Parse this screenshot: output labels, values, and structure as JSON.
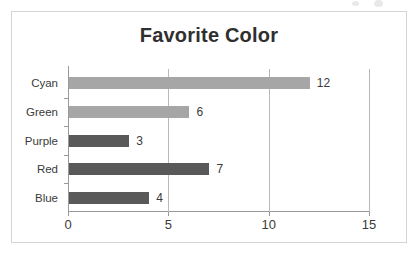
{
  "chart_data": {
    "type": "bar",
    "orientation": "horizontal",
    "title": "Favorite Color",
    "xlabel": "",
    "ylabel": "",
    "categories": [
      "Cyan",
      "Green",
      "Purple",
      "Red",
      "Blue"
    ],
    "values": [
      12,
      6,
      3,
      7,
      4
    ],
    "value_labels": [
      "12",
      "6",
      "3",
      "7",
      "4"
    ],
    "bar_colors": [
      "#a6a6a6",
      "#a6a6a6",
      "#595959",
      "#595959",
      "#595959"
    ],
    "xlim": [
      0,
      15
    ],
    "xticks": [
      0,
      5,
      10,
      15
    ],
    "xtick_labels": [
      "0",
      "5",
      "10",
      "15"
    ],
    "grid": true,
    "grid_axis": "x",
    "legend": false,
    "legend_position": "none",
    "plot_background": "#ffffff",
    "frame_color": "#d4d4d4",
    "axis_color": "#9a9a9a",
    "gridline_color": "#b8b8b8",
    "title_color": "#2f2f2f",
    "text_color": "#3a3a3a"
  }
}
